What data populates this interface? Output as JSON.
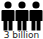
{
  "icon": {
    "name": "people-icon",
    "count": 3,
    "color": "#000000"
  },
  "caption": {
    "text": "3 billion"
  }
}
